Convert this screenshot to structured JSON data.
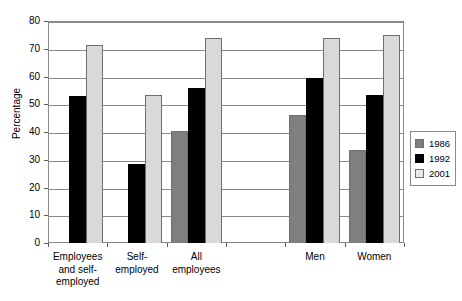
{
  "chart_data": {
    "type": "bar",
    "title": "",
    "xlabel": "",
    "ylabel": "Percentage",
    "ylim": [
      0,
      80
    ],
    "yticks": [
      0,
      10,
      20,
      30,
      40,
      50,
      60,
      70,
      80
    ],
    "grid": true,
    "legend_position": "right",
    "categories": [
      "Employees\nand self-\nemployed",
      "Self-\nemployed",
      "All\nemployees",
      "",
      "Men",
      "Women"
    ],
    "series": [
      {
        "name": "1986",
        "color": "#7f7f7f",
        "values": [
          null,
          null,
          40.5,
          null,
          46.0,
          33.5
        ]
      },
      {
        "name": "1992",
        "color": "#000000",
        "values": [
          53.0,
          28.5,
          56.0,
          null,
          59.5,
          53.5
        ]
      },
      {
        "name": "2001",
        "color": "#d9d9d9",
        "values": [
          71.5,
          53.5,
          74.0,
          null,
          74.0,
          75.0
        ]
      }
    ]
  },
  "axis": {
    "y_title": "Percentage",
    "y_tick_labels": [
      "80",
      "70",
      "60",
      "50",
      "40",
      "30",
      "20",
      "10",
      "0"
    ]
  },
  "legend": {
    "items": [
      {
        "label": "1986",
        "color": "#7f7f7f"
      },
      {
        "label": "1992",
        "color": "#000000"
      },
      {
        "label": "2001",
        "color": "#e8e8e8"
      }
    ]
  }
}
